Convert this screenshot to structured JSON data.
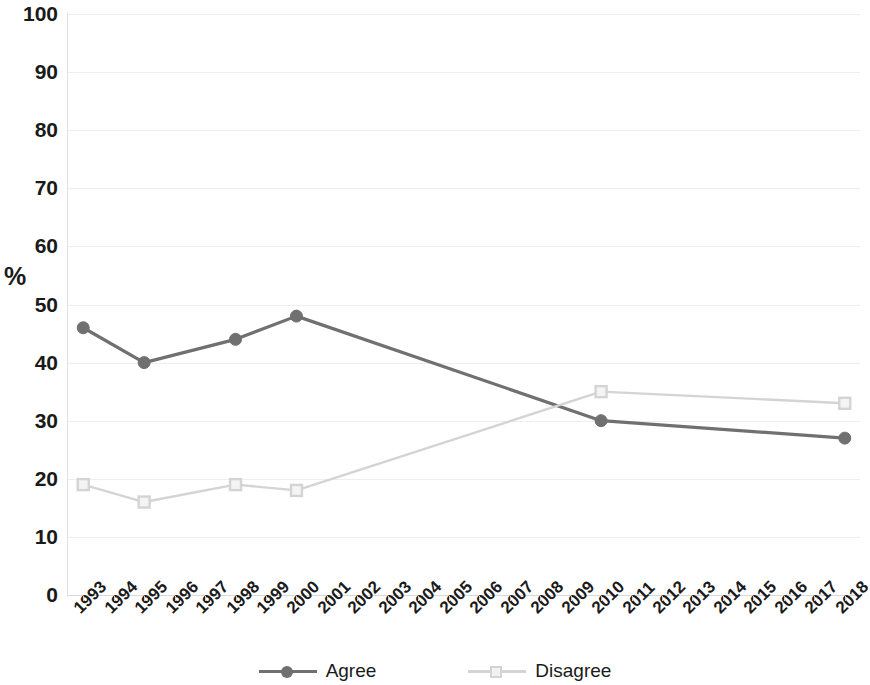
{
  "chart_data": {
    "type": "line",
    "title": "",
    "subtitle": "",
    "xlabel": "",
    "ylabel": "%",
    "ylim": [
      0,
      100
    ],
    "y_ticks": [
      0,
      10,
      20,
      30,
      40,
      50,
      60,
      70,
      80,
      90,
      100
    ],
    "grid": true,
    "legend_position": "bottom",
    "categories": [
      "1993",
      "1994",
      "1995",
      "1996",
      "1997",
      "1998",
      "1999",
      "2000",
      "2001",
      "2002",
      "2003",
      "2004",
      "2005",
      "2006",
      "2007",
      "2008",
      "2009",
      "2010",
      "2011",
      "2012",
      "2013",
      "2014",
      "2015",
      "2016",
      "2017",
      "2018"
    ],
    "series": [
      {
        "name": "Agree",
        "color": "#707070",
        "marker": "circle",
        "x": [
          "1993",
          "1995",
          "1998",
          "2000",
          "2010",
          "2018"
        ],
        "values": [
          46,
          40,
          44,
          48,
          30,
          27
        ]
      },
      {
        "name": "Disagree",
        "color": "#d4d4d4",
        "marker": "square",
        "x": [
          "1993",
          "1995",
          "1998",
          "2000",
          "2010",
          "2018"
        ],
        "values": [
          19,
          16,
          19,
          18,
          35,
          33
        ]
      }
    ]
  },
  "legend": {
    "items": [
      {
        "label": "Agree"
      },
      {
        "label": "Disagree"
      }
    ]
  },
  "axes": {
    "y_title": "%"
  }
}
